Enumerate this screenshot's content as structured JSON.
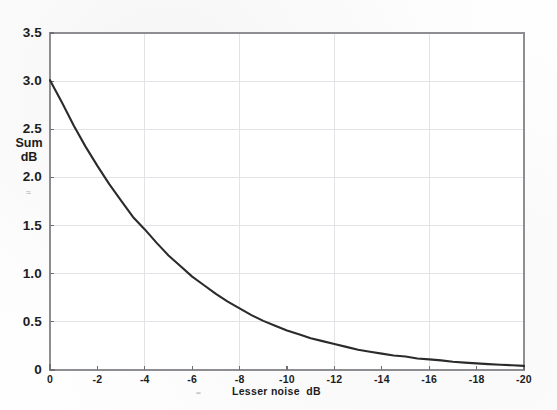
{
  "chart_data": {
    "type": "line",
    "title": "",
    "xlabel": "Lesser noise  dB",
    "ylabel": "Sum\ndB",
    "ylabel_line1": "Sum",
    "ylabel_line2": "dB",
    "xlim": [
      0,
      -20
    ],
    "ylim": [
      0,
      3.5
    ],
    "x_ticks": [
      0,
      -2,
      -4,
      -6,
      -8,
      -10,
      -12,
      -14,
      -16,
      -18,
      -20
    ],
    "x_tick_labels": [
      "0",
      "-2",
      "-4",
      "-6",
      "-8",
      "-10",
      "-12",
      "-14",
      "-16",
      "-18",
      "-20"
    ],
    "y_ticks": [
      0,
      0.5,
      1.0,
      1.5,
      2.0,
      2.5,
      3.0,
      3.5
    ],
    "y_tick_labels": [
      "0",
      "0.5",
      "1.0",
      "1.5",
      "2.0",
      "2.5",
      "3.0",
      "3.5"
    ],
    "grid": true,
    "grid_x_values": [
      -4,
      -8,
      -12,
      -16
    ],
    "grid_y_values": [
      0.5,
      1.0,
      1.5,
      2.0,
      2.5,
      3.0
    ],
    "legend": null,
    "legend_position": "none",
    "series": [
      {
        "name": "Sum dB",
        "color": "#2b2b2b",
        "x": [
          0,
          -0.5,
          -1,
          -1.5,
          -2,
          -2.5,
          -3,
          -3.5,
          -4,
          -4.5,
          -5,
          -5.5,
          -6,
          -6.5,
          -7,
          -7.5,
          -8,
          -8.5,
          -9,
          -9.5,
          -10,
          -10.5,
          -11,
          -11.5,
          -12,
          -12.5,
          -13,
          -13.5,
          -14,
          -14.5,
          -15,
          -15.5,
          -16,
          -16.5,
          -17,
          -17.5,
          -18,
          -18.5,
          -19,
          -19.5,
          -20
        ],
        "y": [
          3.01,
          2.78,
          2.54,
          2.32,
          2.12,
          1.93,
          1.76,
          1.59,
          1.46,
          1.32,
          1.19,
          1.08,
          0.97,
          0.88,
          0.79,
          0.71,
          0.64,
          0.57,
          0.51,
          0.46,
          0.41,
          0.37,
          0.33,
          0.3,
          0.27,
          0.24,
          0.21,
          0.19,
          0.17,
          0.15,
          0.14,
          0.12,
          0.11,
          0.1,
          0.086,
          0.077,
          0.069,
          0.061,
          0.055,
          0.049,
          0.043
        ]
      }
    ],
    "annotations": []
  },
  "figure": {
    "background_color": "#fefefe",
    "frame_color": "#8e8e92",
    "grid_color": "#e2e2e6",
    "curve_color": "#2b2b2b",
    "text_color": "#1d1d1d",
    "scan_artifact_y": "≈",
    "scan_artifact_x": "≈"
  }
}
